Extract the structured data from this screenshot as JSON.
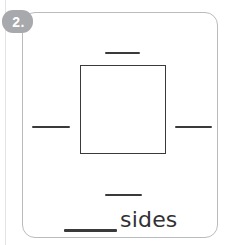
{
  "worksheet": {
    "background_color": "#ffffff",
    "card": {
      "border_color": "#b9bcbe",
      "background_color": "#ffffff"
    },
    "question": {
      "number_label": "2.",
      "badge_color": "#a7a9ac",
      "badge_text_color": "#ffffff"
    },
    "figure": {
      "shape_name": "square",
      "shape_stroke_color": "#3a3a3c",
      "side_blank_count": 4,
      "side_blanks": [
        {
          "position": "top",
          "label": ""
        },
        {
          "position": "right",
          "label": ""
        },
        {
          "position": "bottom",
          "label": ""
        },
        {
          "position": "left",
          "label": ""
        }
      ]
    },
    "answer": {
      "blank_value": "",
      "unit_label": "sides",
      "text_color": "#313133",
      "rule_color": "#3a3a3c"
    }
  }
}
